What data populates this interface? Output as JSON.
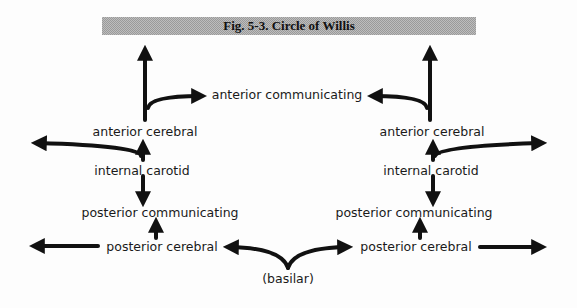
{
  "figure": {
    "title": "Fig. 5-3. Circle of Willis"
  },
  "labels": {
    "anterior_communicating": "anterior communicating",
    "left": {
      "anterior_cerebral": "anterior cerebral",
      "internal_carotid": "internal carotid",
      "posterior_communicating": "posterior communicating",
      "posterior_cerebral": "posterior cerebral"
    },
    "right": {
      "anterior_cerebral": "anterior cerebral",
      "internal_carotid": "internal carotid",
      "posterior_communicating": "posterior communicating",
      "posterior_cerebral": "posterior cerebral"
    },
    "basilar": "(basilar)"
  },
  "colors": {
    "ink": "#111111",
    "title_bar": "#b0b0b0"
  }
}
